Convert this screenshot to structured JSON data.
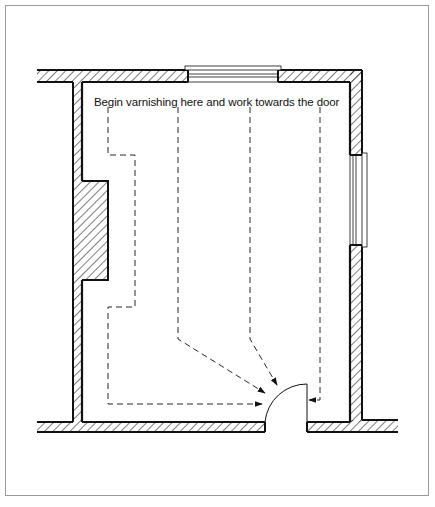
{
  "diagram": {
    "type": "floor-plan",
    "annotation": "Begin varnishing here and work towards  the door",
    "caption_cropped": "",
    "elements": {
      "walls": [
        "top-wall",
        "left-wall",
        "right-wall",
        "bottom-wall",
        "lower-right-wall"
      ],
      "windows": [
        "top-window",
        "right-window"
      ],
      "chimney_breast": "left-chimney-breast",
      "door": "bottom-door",
      "paths": [
        "path-1-perimeter",
        "path-2-center-left",
        "path-3-center-right",
        "path-4-right"
      ],
      "arrows": 4
    },
    "colors": {
      "line": "#111111",
      "frame": "#9a9a9a",
      "background": "#ffffff"
    }
  }
}
